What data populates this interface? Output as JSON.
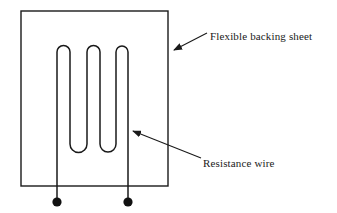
{
  "diagram": {
    "background_color": "#ffffff",
    "stroke_color": "#1a1a1a",
    "labels": {
      "backing_sheet": "Flexible backing sheet",
      "resistance_wire": "Resistance wire"
    },
    "components": {
      "backing_sheet_rect": {
        "name": "flexible backing sheet",
        "x": 21,
        "y": 11,
        "width": 147,
        "height": 175
      },
      "resistance_wire": {
        "name": "resistance wire serpentine grid",
        "vertical_segment_count": 6,
        "top_arc_count": 3,
        "bottom_arc_count": 2,
        "top_y": 46,
        "bottom_y": 150,
        "segment_x_positions": [
          57,
          70,
          87,
          100,
          116,
          128
        ]
      },
      "terminals": [
        {
          "name": "terminal-left",
          "x": 57,
          "y": 202,
          "radius": 4.5
        },
        {
          "name": "terminal-right",
          "x": 128,
          "y": 202,
          "radius": 4.5
        }
      ],
      "leader_backing_sheet": {
        "from_x": 206,
        "from_y": 34,
        "to_x": 172,
        "to_y": 51
      },
      "leader_resistance_wire": {
        "from_x": 200,
        "from_y": 159,
        "to_x": 131,
        "to_y": 131
      }
    }
  }
}
